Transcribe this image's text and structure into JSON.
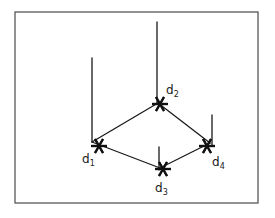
{
  "figure": {
    "background_color": "#ffffff",
    "frame": {
      "name": "figure-border",
      "x": 15,
      "y": 12,
      "width": 243,
      "height": 191,
      "stroke_color": "#4a4a4a",
      "stroke_width": 1.2
    },
    "line_color": "#1a1a1a",
    "line_width": 1.3,
    "marker": {
      "type": "asterisk-star",
      "points": 6,
      "color": "#111111",
      "radius": 8,
      "stroke_width": 2.2
    },
    "vertices": [
      {
        "id": "d1",
        "label": "d",
        "subscript": "1",
        "corner_x": 92,
        "corner_y": 142,
        "marker_x": 99,
        "marker_y": 146,
        "label_x": 82,
        "label_y": 163,
        "stem": {
          "from_y": 58,
          "to_y": 142,
          "x": 92
        }
      },
      {
        "id": "d2",
        "label": "d",
        "subscript": "2",
        "corner_x": 158,
        "corner_y": 103,
        "marker_x": 160,
        "marker_y": 104,
        "label_x": 166,
        "label_y": 94,
        "stem": {
          "from_y": 22,
          "to_y": 103,
          "x": 157
        }
      },
      {
        "id": "d3",
        "label": "d",
        "subscript": "3",
        "corner_x": 160,
        "corner_y": 168,
        "marker_x": 163,
        "marker_y": 169,
        "label_x": 155,
        "label_y": 192,
        "stem": {
          "from_y": 147,
          "to_y": 170,
          "x": 159
        }
      },
      {
        "id": "d4",
        "label": "d",
        "subscript": "4",
        "corner_x": 210,
        "corner_y": 143,
        "marker_x": 207,
        "marker_y": 146,
        "label_x": 212,
        "label_y": 166,
        "stem": {
          "from_y": 115,
          "to_y": 146,
          "x": 212
        }
      }
    ],
    "edges": [
      {
        "name": "edge-d1-d2",
        "from": "d1",
        "to": "d2"
      },
      {
        "name": "edge-d2-d4",
        "from": "d2",
        "to": "d4"
      },
      {
        "name": "edge-d1-d3",
        "from": "d1",
        "to": "d3"
      },
      {
        "name": "edge-d3-d4",
        "from": "d3",
        "to": "d4"
      }
    ]
  }
}
